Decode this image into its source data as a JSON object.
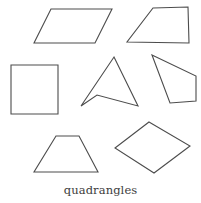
{
  "figure": {
    "caption": "quadrangles",
    "background_color": "#ffffff",
    "stroke_color": "#4c4c4c",
    "fill_color": "#ffffff",
    "width": 201,
    "height": 203
  },
  "chart_data": {
    "type": "diagram",
    "title": "quadrangles",
    "subtitle": "",
    "xlabel": "",
    "ylabel": "",
    "item_count": 7,
    "legend": [],
    "grid": false,
    "axis_ranges": {
      "x": [
        0,
        201
      ],
      "y": [
        0,
        203
      ]
    },
    "shapes": [
      {
        "id": "parallelogram-top-left",
        "label": "parallelogram",
        "row": 1,
        "column": 1,
        "points": "51,9 112,9 95,43 34,43",
        "vertex_count": 4
      },
      {
        "id": "trapezoid-top-right",
        "label": "trapezoid",
        "row": 1,
        "column": 2,
        "points": "153,8 188,7 189,43 127,42",
        "vertex_count": 4
      },
      {
        "id": "square-middle-left",
        "label": "square",
        "row": 2,
        "column": 1,
        "points": "11,65 58,65 58,114 11,114",
        "vertex_count": 4
      },
      {
        "id": "dart-middle-center",
        "label": "concave quadrilateral (dart)",
        "row": 2,
        "column": 2,
        "points": "114,57 138,106 97,95 81,106",
        "vertex_count": 4
      },
      {
        "id": "irregular-quad-middle-right",
        "label": "irregular quadrilateral",
        "row": 2,
        "column": 3,
        "points": "152,55 196,76 196,101 170,103",
        "vertex_count": 4
      },
      {
        "id": "trapezoid-bottom-left",
        "label": "isosceles trapezoid",
        "row": 3,
        "column": 1,
        "points": "56,136 79,136 98,172 34,172",
        "vertex_count": 4
      },
      {
        "id": "rhombus-bottom-right",
        "label": "rhombus",
        "row": 3,
        "column": 2,
        "points": "149,122 190,146 154,173 115,148",
        "vertex_count": 4
      }
    ]
  }
}
